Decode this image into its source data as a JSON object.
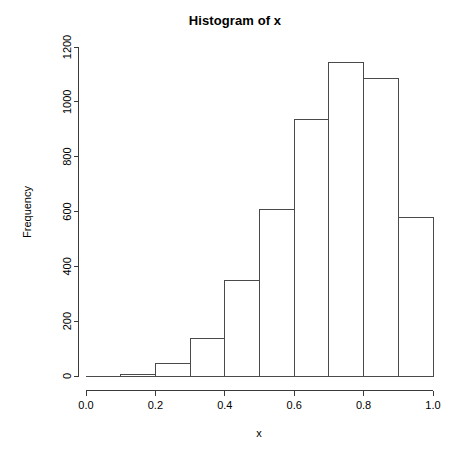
{
  "chart_data": {
    "type": "bar",
    "title": "Histogram of x",
    "xlabel": "x",
    "ylabel": "Frequency",
    "categories": [
      "0.0-0.1",
      "0.1-0.2",
      "0.2-0.3",
      "0.3-0.4",
      "0.4-0.5",
      "0.5-0.6",
      "0.6-0.7",
      "0.7-0.8",
      "0.8-0.9",
      "0.9-1.0"
    ],
    "bin_edges": [
      0.0,
      0.1,
      0.2,
      0.3,
      0.4,
      0.5,
      0.6,
      0.7,
      0.8,
      0.9,
      1.0
    ],
    "values": [
      0,
      7,
      45,
      135,
      348,
      608,
      935,
      1145,
      1085,
      578
    ],
    "xlim": [
      0.0,
      1.0
    ],
    "ylim": [
      0,
      1200
    ],
    "xticks": [
      0.0,
      0.2,
      0.4,
      0.6,
      0.8,
      1.0
    ],
    "xtick_labels": [
      "0.0",
      "0.2",
      "0.4",
      "0.6",
      "0.8",
      "1.0"
    ],
    "yticks": [
      0,
      200,
      400,
      600,
      800,
      1000,
      1200
    ],
    "ytick_labels": [
      "0",
      "200",
      "400",
      "600",
      "800",
      "1000",
      "1200"
    ],
    "grid": false,
    "legend": null,
    "bar_fill": "#ffffff",
    "bar_stroke": "#4a4a4a",
    "axis_color": "#3a3a3a",
    "background": "#ffffff"
  }
}
